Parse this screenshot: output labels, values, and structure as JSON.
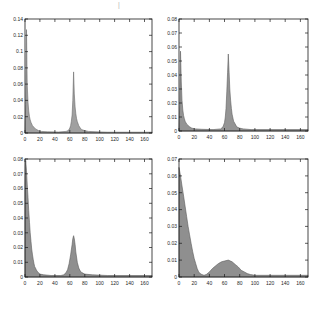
{
  "figure": {
    "background": "#ffffff",
    "title_mark": "|",
    "frame_color": "#1a1a1a",
    "tick_label_color": "#262626"
  },
  "chart_data": [
    {
      "type": "area",
      "name": "top-left",
      "title": "",
      "xlabel": "",
      "ylabel": "",
      "xlim": [
        0,
        170
      ],
      "ylim": [
        0,
        0.14
      ],
      "grid": false,
      "legend": "none",
      "fill_color": "#a0a0a0",
      "edge_color": "#6b6b6b",
      "xticks": [
        0,
        20,
        40,
        60,
        80,
        100,
        120,
        140,
        160
      ],
      "yticks": [
        0,
        0.02,
        0.04,
        0.06,
        0.08,
        0.1,
        0.12,
        0.14
      ],
      "ytick_labels": [
        "0",
        "0.02",
        "0.04",
        "0.06",
        "0.08",
        "0.1",
        "0.12",
        "0.14"
      ],
      "series": [
        {
          "name": "density",
          "points": [
            [
              0,
              0.002
            ],
            [
              1,
              0.035
            ],
            [
              1.5,
              0.08
            ],
            [
              2,
              0.127
            ],
            [
              2.5,
              0.09
            ],
            [
              3,
              0.06
            ],
            [
              4,
              0.038
            ],
            [
              5,
              0.027
            ],
            [
              6,
              0.02
            ],
            [
              7,
              0.016
            ],
            [
              8,
              0.013
            ],
            [
              10,
              0.009
            ],
            [
              12,
              0.007
            ],
            [
              14,
              0.005
            ],
            [
              16,
              0.004
            ],
            [
              18,
              0.003
            ],
            [
              22,
              0.002
            ],
            [
              30,
              0.0015
            ],
            [
              45,
              0.0012
            ],
            [
              55,
              0.002
            ],
            [
              58,
              0.003
            ],
            [
              60,
              0.006
            ],
            [
              61,
              0.009
            ],
            [
              62,
              0.014
            ],
            [
              63,
              0.022
            ],
            [
              64,
              0.04
            ],
            [
              65,
              0.075
            ],
            [
              66,
              0.048
            ],
            [
              67,
              0.032
            ],
            [
              68,
              0.024
            ],
            [
              69,
              0.018
            ],
            [
              70,
              0.014
            ],
            [
              72,
              0.009
            ],
            [
              74,
              0.006
            ],
            [
              76,
              0.004
            ],
            [
              80,
              0.003
            ],
            [
              85,
              0.002
            ],
            [
              95,
              0.0015
            ],
            [
              110,
              0.001
            ],
            [
              170,
              0.001
            ]
          ]
        }
      ]
    },
    {
      "type": "area",
      "name": "top-right",
      "title": "",
      "xlabel": "",
      "ylabel": "",
      "xlim": [
        0,
        170
      ],
      "ylim": [
        0,
        0.08
      ],
      "grid": false,
      "legend": "none",
      "fill_color": "#949494",
      "edge_color": "#606060",
      "xticks": [
        0,
        20,
        40,
        60,
        80,
        100,
        120,
        140,
        160
      ],
      "yticks": [
        0,
        0.01,
        0.02,
        0.03,
        0.04,
        0.05,
        0.06,
        0.07,
        0.08
      ],
      "ytick_labels": [
        "0",
        "0.01",
        "0.02",
        "0.03",
        "0.04",
        "0.05",
        "0.06",
        "0.07",
        "0.08"
      ],
      "series": [
        {
          "name": "density",
          "points": [
            [
              0,
              0.002
            ],
            [
              1,
              0.02
            ],
            [
              1.5,
              0.04
            ],
            [
              2,
              0.057
            ],
            [
              3,
              0.035
            ],
            [
              4,
              0.022
            ],
            [
              5,
              0.015
            ],
            [
              6,
              0.011
            ],
            [
              7,
              0.009
            ],
            [
              8,
              0.007
            ],
            [
              10,
              0.005
            ],
            [
              12,
              0.004
            ],
            [
              14,
              0.003
            ],
            [
              17,
              0.002
            ],
            [
              22,
              0.0015
            ],
            [
              30,
              0.0012
            ],
            [
              45,
              0.001
            ],
            [
              55,
              0.0015
            ],
            [
              58,
              0.003
            ],
            [
              60,
              0.006
            ],
            [
              61,
              0.01
            ],
            [
              62,
              0.016
            ],
            [
              63,
              0.028
            ],
            [
              64,
              0.042
            ],
            [
              65,
              0.055
            ],
            [
              66,
              0.042
            ],
            [
              67,
              0.03
            ],
            [
              68,
              0.022
            ],
            [
              69,
              0.016
            ],
            [
              70,
              0.012
            ],
            [
              72,
              0.007
            ],
            [
              74,
              0.005
            ],
            [
              76,
              0.003
            ],
            [
              80,
              0.002
            ],
            [
              85,
              0.0015
            ],
            [
              95,
              0.001
            ],
            [
              170,
              0.001
            ]
          ]
        }
      ]
    },
    {
      "type": "area",
      "name": "bottom-left",
      "title": "",
      "xlabel": "",
      "ylabel": "",
      "xlim": [
        0,
        170
      ],
      "ylim": [
        0,
        0.08
      ],
      "grid": false,
      "legend": "none",
      "fill_color": "#8f8f8f",
      "edge_color": "#5c5c5c",
      "xticks": [
        0,
        20,
        40,
        60,
        80,
        100,
        120,
        140,
        160
      ],
      "yticks": [
        0,
        0.01,
        0.02,
        0.03,
        0.04,
        0.05,
        0.06,
        0.07,
        0.08
      ],
      "ytick_labels": [
        "0",
        "0.01",
        "0.02",
        "0.03",
        "0.04",
        "0.05",
        "0.06",
        "0.07",
        "0.08"
      ],
      "series": [
        {
          "name": "density",
          "points": [
            [
              0,
              0.06
            ],
            [
              0.5,
              0.075
            ],
            [
              1,
              0.079
            ],
            [
              2,
              0.072
            ],
            [
              3,
              0.063
            ],
            [
              4,
              0.054
            ],
            [
              5,
              0.045
            ],
            [
              6,
              0.037
            ],
            [
              7,
              0.03
            ],
            [
              8,
              0.024
            ],
            [
              9,
              0.019
            ],
            [
              10,
              0.015
            ],
            [
              11,
              0.012
            ],
            [
              12,
              0.009
            ],
            [
              13,
              0.007
            ],
            [
              14,
              0.006
            ],
            [
              15,
              0.005
            ],
            [
              16,
              0.004
            ],
            [
              18,
              0.003
            ],
            [
              20,
              0.002
            ],
            [
              25,
              0.0015
            ],
            [
              35,
              0.001
            ],
            [
              48,
              0.001
            ],
            [
              52,
              0.0015
            ],
            [
              55,
              0.003
            ],
            [
              57,
              0.005
            ],
            [
              59,
              0.009
            ],
            [
              61,
              0.015
            ],
            [
              63,
              0.022
            ],
            [
              64,
              0.026
            ],
            [
              65,
              0.028
            ],
            [
              66,
              0.026
            ],
            [
              67,
              0.022
            ],
            [
              68,
              0.017
            ],
            [
              70,
              0.01
            ],
            [
              72,
              0.006
            ],
            [
              74,
              0.004
            ],
            [
              76,
              0.003
            ],
            [
              80,
              0.002
            ],
            [
              90,
              0.0015
            ],
            [
              110,
              0.001
            ],
            [
              170,
              0.001
            ]
          ]
        }
      ]
    },
    {
      "type": "area",
      "name": "bottom-right",
      "title": "",
      "xlabel": "",
      "ylabel": "",
      "xlim": [
        0,
        170
      ],
      "ylim": [
        0,
        0.07
      ],
      "grid": false,
      "legend": "none",
      "fill_color": "#8f8f8f",
      "edge_color": "#5c5c5c",
      "xticks": [
        0,
        20,
        40,
        60,
        80,
        100,
        120,
        140,
        160
      ],
      "yticks": [
        0,
        0.01,
        0.02,
        0.03,
        0.04,
        0.05,
        0.06,
        0.07
      ],
      "ytick_labels": [
        "0",
        "0.01",
        "0.02",
        "0.03",
        "0.04",
        "0.05",
        "0.06",
        "0.07"
      ],
      "series": [
        {
          "name": "density",
          "points": [
            [
              0,
              0.065
            ],
            [
              2,
              0.06
            ],
            [
              4,
              0.054
            ],
            [
              6,
              0.048
            ],
            [
              8,
              0.042
            ],
            [
              10,
              0.036
            ],
            [
              12,
              0.03
            ],
            [
              14,
              0.025
            ],
            [
              16,
              0.02
            ],
            [
              18,
              0.015
            ],
            [
              20,
              0.011
            ],
            [
              22,
              0.008
            ],
            [
              24,
              0.005
            ],
            [
              26,
              0.003
            ],
            [
              28,
              0.002
            ],
            [
              30,
              0.0015
            ],
            [
              33,
              0.001
            ],
            [
              36,
              0.0015
            ],
            [
              40,
              0.003
            ],
            [
              44,
              0.005
            ],
            [
              48,
              0.0065
            ],
            [
              52,
              0.008
            ],
            [
              56,
              0.009
            ],
            [
              60,
              0.0095
            ],
            [
              65,
              0.01
            ],
            [
              70,
              0.009
            ],
            [
              74,
              0.0075
            ],
            [
              78,
              0.006
            ],
            [
              82,
              0.004
            ],
            [
              86,
              0.003
            ],
            [
              90,
              0.002
            ],
            [
              94,
              0.0015
            ],
            [
              100,
              0.001
            ],
            [
              120,
              0.001
            ],
            [
              170,
              0.001
            ]
          ]
        }
      ]
    }
  ]
}
